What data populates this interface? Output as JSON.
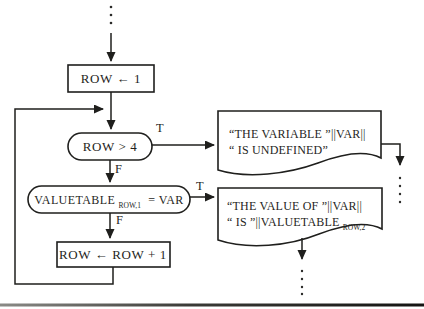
{
  "flowchart": {
    "branch_labels": {
      "true": "T",
      "false": "F"
    },
    "nodes": {
      "init": {
        "label": "ROW ← 1"
      },
      "row_test": {
        "label": "ROW > 4"
      },
      "value_test": {
        "base": "VALUETABLE",
        "subscript": "ROW,1",
        "comparison": "= VAR"
      },
      "increment": {
        "label": "ROW ← ROW + 1"
      }
    },
    "outputs": {
      "undefined_message": {
        "line1": "“THE VARIABLE ”||VAR||",
        "line2": "“ IS UNDEFINED”"
      },
      "value_message": {
        "line1": "“THE VALUE OF ”||VAR||",
        "line2_base": "“ IS ”||VALUETABLE",
        "line2_subscript": "ROW,2"
      }
    },
    "colors": {
      "ink": "#1f1f1d",
      "paper": "#ffffff"
    }
  }
}
